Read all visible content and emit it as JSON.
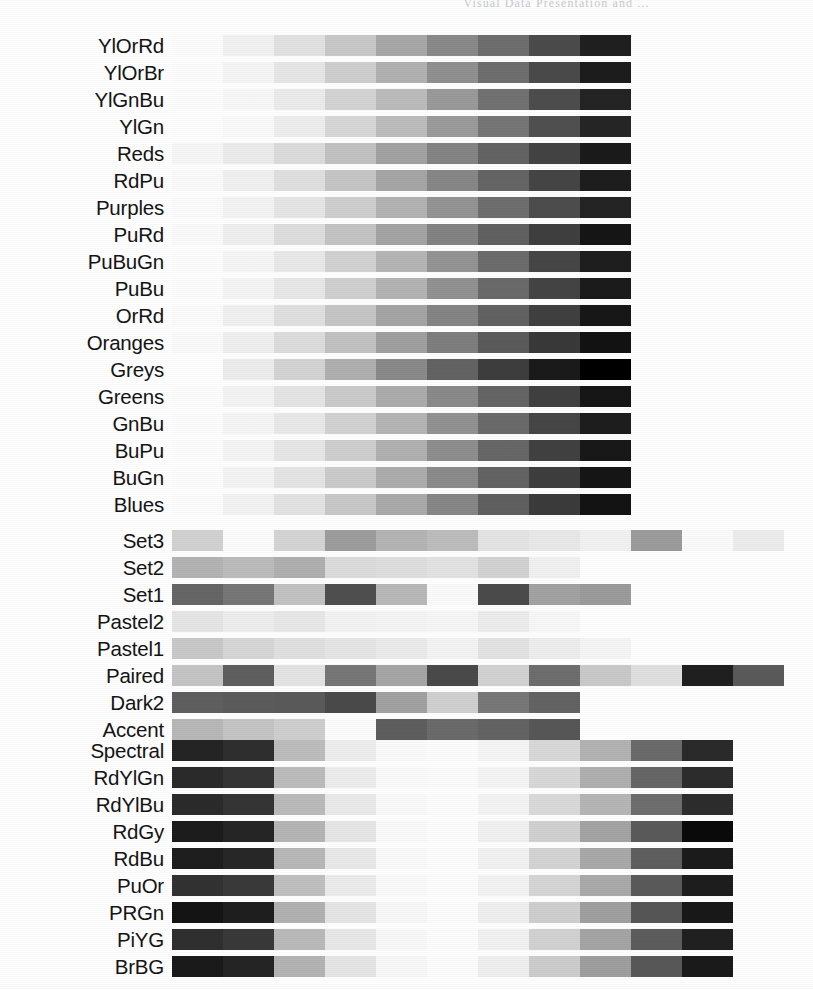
{
  "page_header": {
    "text": "Visual Data Presentation and ..."
  },
  "figure": {
    "title": "",
    "geometry": {
      "label_column_width": 172,
      "bar_left": 180,
      "swatch_width": 51,
      "swatch_height": 21,
      "row_pitch": 27
    },
    "groups": [
      {
        "name": "sequential",
        "top": 32,
        "rows": [
          {
            "label": "YlOrRd",
            "n": 9,
            "values": [
              "#fdfdfd",
              "#f2f2f2",
              "#e2e2e2",
              "#c9c9c9",
              "#a8a8a8",
              "#8a8a8a",
              "#6f6f6f",
              "#4b4b4b",
              "#1f1f1f"
            ]
          },
          {
            "label": "YlOrBr",
            "n": 9,
            "values": [
              "#fdfdfd",
              "#f6f6f6",
              "#e7e7e7",
              "#cfcfcf",
              "#b2b2b2",
              "#909090",
              "#6e6e6e",
              "#4a4a4a",
              "#1c1c1c"
            ]
          },
          {
            "label": "YlGnBu",
            "n": 9,
            "values": [
              "#fdfdfd",
              "#f8f8f8",
              "#ececec",
              "#d4d4d4",
              "#bcbcbc",
              "#9a9a9a",
              "#727272",
              "#4d4d4d",
              "#242424"
            ]
          },
          {
            "label": "YlGn",
            "n": 9,
            "values": [
              "#fefefe",
              "#fafafa",
              "#eeeeee",
              "#d8d8d8",
              "#bdbdbd",
              "#9b9b9b",
              "#767676",
              "#505050",
              "#262626"
            ]
          },
          {
            "label": "Reds",
            "n": 9,
            "values": [
              "#f7f7f7",
              "#ececec",
              "#dcdcdc",
              "#c2c2c2",
              "#a2a2a2",
              "#848484",
              "#636363",
              "#434343",
              "#1a1a1a"
            ]
          },
          {
            "label": "RdPu",
            "n": 9,
            "values": [
              "#fbfbfb",
              "#f1f1f1",
              "#e0e0e0",
              "#c6c6c6",
              "#a6a6a6",
              "#878787",
              "#656565",
              "#454545",
              "#1d1d1d"
            ]
          },
          {
            "label": "Purples",
            "n": 9,
            "values": [
              "#fcfcfc",
              "#f4f4f4",
              "#e6e6e6",
              "#cfcfcf",
              "#b3b3b3",
              "#949494",
              "#6f6f6f",
              "#4d4d4d",
              "#242424"
            ]
          },
          {
            "label": "PuRd",
            "n": 9,
            "values": [
              "#fbfbfb",
              "#f0f0f0",
              "#dedede",
              "#c4c4c4",
              "#a4a4a4",
              "#838383",
              "#616161",
              "#3f3f3f",
              "#151515"
            ]
          },
          {
            "label": "PuBuGn",
            "n": 9,
            "values": [
              "#fdfdfd",
              "#f6f6f6",
              "#e9e9e9",
              "#d2d2d2",
              "#b6b6b6",
              "#949494",
              "#6c6c6c",
              "#464646",
              "#1e1e1e"
            ]
          },
          {
            "label": "PuBu",
            "n": 9,
            "values": [
              "#fdfdfd",
              "#f5f5f5",
              "#e8e8e8",
              "#d0d0d0",
              "#b4b4b4",
              "#929292",
              "#6a6a6a",
              "#444444",
              "#1b1b1b"
            ]
          },
          {
            "label": "OrRd",
            "n": 9,
            "values": [
              "#fcfcfc",
              "#f1f1f1",
              "#e0e0e0",
              "#c6c6c6",
              "#a5a5a5",
              "#858585",
              "#626262",
              "#404040",
              "#171717"
            ]
          },
          {
            "label": "Oranges",
            "n": 9,
            "values": [
              "#fbfbfb",
              "#f0f0f0",
              "#dddddd",
              "#c2c2c2",
              "#a0a0a0",
              "#7e7e7e",
              "#5b5b5b",
              "#393939",
              "#121212"
            ]
          },
          {
            "label": "Greys",
            "n": 9,
            "values": [
              "#ffffff",
              "#ededed",
              "#d4d4d4",
              "#b0b0b0",
              "#8a8a8a",
              "#636363",
              "#3d3d3d",
              "#1a1a1a",
              "#000000"
            ]
          },
          {
            "label": "Greens",
            "n": 9,
            "values": [
              "#fdfdfd",
              "#f4f4f4",
              "#e5e5e5",
              "#cbcbcb",
              "#acacac",
              "#8a8a8a",
              "#656565",
              "#404040",
              "#161616"
            ]
          },
          {
            "label": "GnBu",
            "n": 9,
            "values": [
              "#fdfdfd",
              "#f6f6f6",
              "#e9e9e9",
              "#d2d2d2",
              "#b5b5b5",
              "#929292",
              "#6b6b6b",
              "#464646",
              "#1d1d1d"
            ]
          },
          {
            "label": "BuPu",
            "n": 9,
            "values": [
              "#fdfdfd",
              "#f5f5f5",
              "#e7e7e7",
              "#cfcfcf",
              "#b1b1b1",
              "#8e8e8e",
              "#676767",
              "#414141",
              "#181818"
            ]
          },
          {
            "label": "BuGn",
            "n": 9,
            "values": [
              "#fdfdfd",
              "#f4f4f4",
              "#e5e5e5",
              "#cccccc",
              "#adadad",
              "#8b8b8b",
              "#646464",
              "#3e3e3e",
              "#151515"
            ]
          },
          {
            "label": "Blues",
            "n": 9,
            "values": [
              "#fdfdfd",
              "#f3f3f3",
              "#e3e3e3",
              "#c9c9c9",
              "#aaaaaa",
              "#878787",
              "#606060",
              "#3b3b3b",
              "#131313"
            ]
          }
        ]
      },
      {
        "name": "qualitative",
        "top": 527,
        "rows": [
          {
            "label": "Set3",
            "n": 12,
            "values": [
              "#d2d2d2",
              "#fcfcfc",
              "#d5d5d5",
              "#9d9d9d",
              "#b5b5b5",
              "#bdbdbd",
              "#e4e4e4",
              "#e9e9e9",
              "#f2f2f2",
              "#9c9c9c",
              "#fbfbfb",
              "#ededed"
            ]
          },
          {
            "label": "Set2",
            "n": 8,
            "values": [
              "#b4b4b4",
              "#bcbcbc",
              "#b0b0b0",
              "#dcdcdc",
              "#dfdfdf",
              "#e3e3e3",
              "#d3d3d3",
              "#f1f1f1"
            ]
          },
          {
            "label": "Set1",
            "n": 9,
            "values": [
              "#666666",
              "#777777",
              "#c2c2c2",
              "#4f4f4f",
              "#b9b9b9",
              "#fbfbfb",
              "#4b4b4b",
              "#a3a3a3",
              "#9b9b9b"
            ]
          },
          {
            "label": "Pastel2",
            "n": 8,
            "values": [
              "#e6e6e6",
              "#eeeeee",
              "#e8e8e8",
              "#f3f3f3",
              "#f5f5f5",
              "#f7f7f7",
              "#ededed",
              "#f8f8f8"
            ]
          },
          {
            "label": "Pastel1",
            "n": 9,
            "values": [
              "#c9c9c9",
              "#d7d7d7",
              "#e1e1e1",
              "#e6e6e6",
              "#ebebeb",
              "#f4f4f4",
              "#e3e3e3",
              "#eeeeee",
              "#f6f6f6"
            ]
          },
          {
            "label": "Paired",
            "n": 12,
            "values": [
              "#c5c5c5",
              "#5f5f5f",
              "#e4e4e4",
              "#777777",
              "#a6a6a6",
              "#4a4a4a",
              "#d2d2d2",
              "#6e6e6e",
              "#cacaca",
              "#e0e0e0",
              "#1f1f1f",
              "#5a5a5a"
            ]
          },
          {
            "label": "Dark2",
            "n": 8,
            "values": [
              "#5f5f5f",
              "#5c5c5c",
              "#5a5a5a",
              "#4a4a4a",
              "#a1a1a1",
              "#d0d0d0",
              "#787878",
              "#636363"
            ]
          },
          {
            "label": "Accent",
            "n": 8,
            "values": [
              "#b8b8b8",
              "#c5c5c5",
              "#cfcfcf",
              "#fdfdfd",
              "#5e5e5e",
              "#6b6b6b",
              "#646464",
              "#575757"
            ]
          }
        ]
      },
      {
        "name": "diverging",
        "top": 737,
        "rows": [
          {
            "label": "Spectral",
            "n": 11,
            "values": [
              "#242424",
              "#2e2e2e",
              "#bdbdbd",
              "#eeeeee",
              "#fbfbfb",
              "#fdfdfd",
              "#f6f6f6",
              "#d9d9d9",
              "#b3b3b3",
              "#6b6b6b",
              "#2a2a2a"
            ]
          },
          {
            "label": "RdYlGn",
            "n": 11,
            "values": [
              "#2a2a2a",
              "#343434",
              "#bcbcbc",
              "#ededed",
              "#fbfbfb",
              "#fcfcfc",
              "#f5f5f5",
              "#d8d8d8",
              "#b0b0b0",
              "#666666",
              "#2c2c2c"
            ]
          },
          {
            "label": "RdYlBu",
            "n": 11,
            "values": [
              "#2b2b2b",
              "#343434",
              "#bbbbbb",
              "#eaeaea",
              "#fafafa",
              "#fdfdfd",
              "#f4f4f4",
              "#dadada",
              "#b6b6b6",
              "#6e6e6e",
              "#2d2d2d"
            ]
          },
          {
            "label": "RdGy",
            "n": 11,
            "values": [
              "#1c1c1c",
              "#252525",
              "#b6b6b6",
              "#e7e7e7",
              "#fafafa",
              "#fdfdfd",
              "#f1f1f1",
              "#d1d1d1",
              "#a4a4a4",
              "#5a5a5a",
              "#0a0a0a"
            ]
          },
          {
            "label": "RdBu",
            "n": 11,
            "values": [
              "#1e1e1e",
              "#282828",
              "#b8b8b8",
              "#e9e9e9",
              "#fafafa",
              "#fdfdfd",
              "#f2f2f2",
              "#d4d4d4",
              "#a9a9a9",
              "#5f5f5f",
              "#1b1b1b"
            ]
          },
          {
            "label": "PuOr",
            "n": 11,
            "values": [
              "#323232",
              "#3a3a3a",
              "#c0c0c0",
              "#ececec",
              "#fafafa",
              "#fdfdfd",
              "#f3f3f3",
              "#d6d6d6",
              "#aaaaaa",
              "#5a5a5a",
              "#1d1d1d"
            ]
          },
          {
            "label": "PRGn",
            "n": 11,
            "values": [
              "#141414",
              "#1e1e1e",
              "#b2b2b2",
              "#e6e6e6",
              "#f8f8f8",
              "#fdfdfd",
              "#f0f0f0",
              "#cfcfcf",
              "#a0a0a0",
              "#565656",
              "#181818"
            ]
          },
          {
            "label": "PiYG",
            "n": 11,
            "values": [
              "#2f2f2f",
              "#393939",
              "#bababa",
              "#e8e8e8",
              "#f9f9f9",
              "#fdfdfd",
              "#f2f2f2",
              "#d2d2d2",
              "#a5a5a5",
              "#5d5d5d",
              "#202020"
            ]
          },
          {
            "label": "BrBG",
            "n": 11,
            "values": [
              "#1a1a1a",
              "#242424",
              "#b4b4b4",
              "#e6e6e6",
              "#f8f8f8",
              "#fdfdfd",
              "#f0f0f0",
              "#cdcdcd",
              "#9f9f9f",
              "#585858",
              "#1a1a1a"
            ]
          }
        ]
      }
    ]
  },
  "chart_data": {
    "type": "table",
    "xlabel": "",
    "ylabel": "",
    "legend": [],
    "grid": false,
    "groups": [
      "sequential",
      "qualitative",
      "diverging"
    ],
    "sequential_names": [
      "YlOrRd",
      "YlOrBr",
      "YlGnBu",
      "YlGn",
      "Reds",
      "RdPu",
      "Purples",
      "PuRd",
      "PuBuGn",
      "PuBu",
      "OrRd",
      "Oranges",
      "Greys",
      "Greens",
      "GnBu",
      "BuPu",
      "BuGn",
      "Blues"
    ],
    "qualitative_names": [
      "Set3",
      "Set2",
      "Set1",
      "Pastel2",
      "Pastel1",
      "Paired",
      "Dark2",
      "Accent"
    ],
    "diverging_names": [
      "Spectral",
      "RdYlGn",
      "RdYlBu",
      "RdGy",
      "RdBu",
      "PuOr",
      "PRGn",
      "PiYG",
      "BrBG"
    ],
    "sequential_swatch_count": 9,
    "diverging_swatch_count": 11,
    "qualitative_swatch_counts": {
      "Set3": 12,
      "Set2": 8,
      "Set1": 9,
      "Pastel2": 8,
      "Pastel1": 9,
      "Paired": 12,
      "Dark2": 8,
      "Accent": 8
    },
    "total_colormaps": 35
  }
}
